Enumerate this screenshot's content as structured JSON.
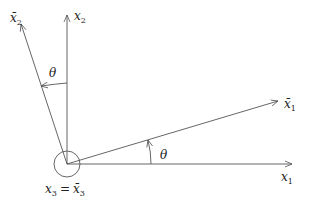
{
  "diagram": {
    "type": "coordinate-rotation",
    "colors": {
      "line": "#555555",
      "text": "#222222",
      "background": "#ffffff"
    },
    "labels": {
      "x1": {
        "base": "x",
        "sub": "1"
      },
      "x2": {
        "base": "x",
        "sub": "2"
      },
      "x1bar": {
        "base": "x̄",
        "sub": "1"
      },
      "x2bar": {
        "base": "x̄",
        "sub": "2"
      },
      "x3": {
        "base": "x",
        "sub": "3",
        "eq": "=",
        "base2": "x̄",
        "sub2": "3"
      },
      "theta_upper": "θ",
      "theta_lower": "θ"
    }
  }
}
